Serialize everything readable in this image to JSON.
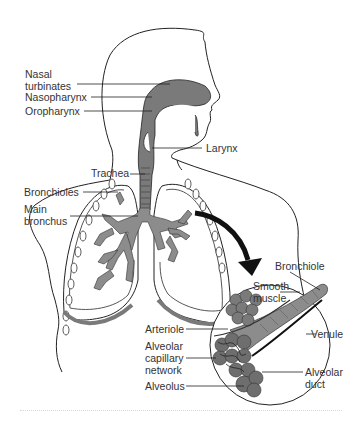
{
  "figure": {
    "colors": {
      "outline": "#222222",
      "airway_fill": "#7a7a7a",
      "bronchi_fill": "#8c8c8c",
      "alveoli_fill": "#6e6e6e",
      "background": "#ffffff",
      "label_text": "#333333"
    },
    "labels": {
      "nasal_turbinates": "Nasal\nturbinates",
      "nasopharynx": "Nasopharynx",
      "oropharynx": "Oropharynx",
      "larynx": "Larynx",
      "trachea": "Trachea",
      "bronchioles": "Bronchioles",
      "main_bronchus": "Main\nbronchus",
      "bronchiole": "Bronchiole",
      "smooth_muscle": "Smooth\nmuscle",
      "arteriole": "Arteriole",
      "venule": "Venule",
      "alveolar_capillary_network": "Alveolar\ncapillary\nnetwork",
      "alveolar_duct": "Alveolar\nduct",
      "alveolus": "Alveolus"
    }
  }
}
